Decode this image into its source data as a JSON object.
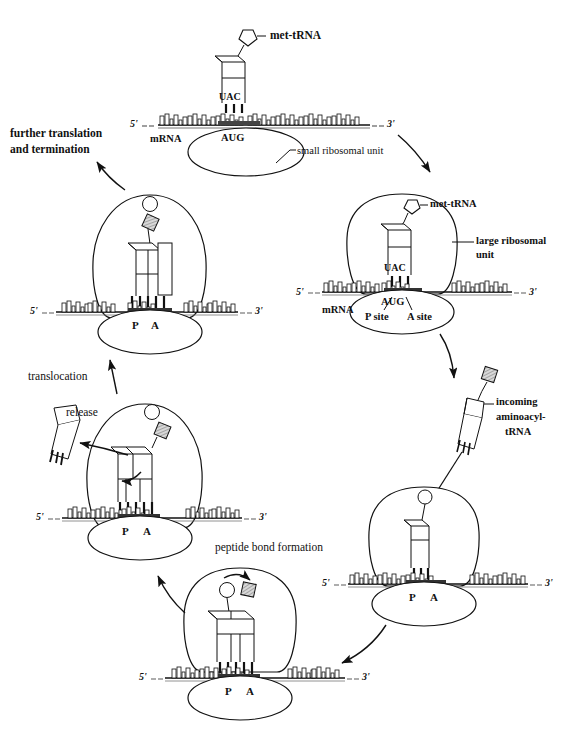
{
  "figure": {
    "type": "biology-process-diagram",
    "background_color": "#ffffff",
    "line_color": "#111111",
    "shading_color": "#9a9a9a"
  },
  "labels": {
    "met_trna_top": "met-tRNA",
    "met_trna_right": "met-tRNA",
    "mrna_top": "mRNA",
    "mrna_right": "mRNA",
    "small_ribosomal_unit": "small ribosomal unit",
    "large_ribosomal_unit": "large ribosomal\nunit",
    "large_ribosomal_unit_line1": "large ribosomal",
    "large_ribosomal_unit_line2": "unit",
    "further_translation_line1": "further translation",
    "further_translation_line2": "and termination",
    "translocation": "translocation",
    "release": "release",
    "peptide_bond_formation": "peptide bond formation",
    "incoming_line1": "incoming",
    "incoming_line2": "aminoacyl-",
    "incoming_line3": "tRNA",
    "p_site": "P site",
    "a_site": "A site",
    "p": "P",
    "a": "A",
    "five_prime": "5'",
    "three_prime": "3'",
    "codon_anticodon_uac": "UAC",
    "codon_aug": "AUG"
  },
  "stages": [
    {
      "id": "stage-1-initiation",
      "name": "initiation-small-subunit",
      "position": "top-center",
      "elements": [
        "mRNA strand",
        "small ribosomal unit",
        "met-tRNA",
        "UAC anticodon",
        "AUG codon"
      ],
      "labels": [
        "met-tRNA",
        "mRNA",
        "AUG",
        "UAC",
        "small ribosomal unit",
        "5'",
        "3'"
      ]
    },
    {
      "id": "stage-2-large-subunit-joins",
      "name": "large-subunit-assembly",
      "position": "middle-right",
      "elements": [
        "mRNA strand",
        "small ribosomal unit",
        "large ribosomal unit",
        "met-tRNA in P site"
      ],
      "labels": [
        "met-tRNA",
        "large ribosomal unit",
        "mRNA",
        "AUG",
        "UAC",
        "P site",
        "A site",
        "5'",
        "3'"
      ]
    },
    {
      "id": "stage-3-aminoacyl-trna-entry",
      "name": "incoming-aminoacyl-trna",
      "position": "lower-right",
      "elements": [
        "ribosome complex",
        "incoming aminoacyl-tRNA"
      ],
      "labels": [
        "incoming aminoacyl-tRNA",
        "P",
        "A",
        "5'",
        "3'"
      ]
    },
    {
      "id": "stage-4-peptide-bond",
      "name": "peptide-bond-formation",
      "position": "bottom-center",
      "elements": [
        "ribosome complex",
        "two tRNAs in P and A sites",
        "peptide bond arrow"
      ],
      "labels": [
        "peptide bond formation",
        "P",
        "A",
        "5'",
        "3'"
      ]
    },
    {
      "id": "stage-5-translocation-release",
      "name": "translocation-and-trna-release",
      "position": "middle-left",
      "elements": [
        "ribosome complex",
        "released empty tRNA",
        "translocation arrow"
      ],
      "labels": [
        "translocation",
        "release",
        "P",
        "A",
        "5'",
        "3'"
      ]
    },
    {
      "id": "stage-6-elongation",
      "name": "elongating-polypeptide",
      "position": "upper-left",
      "elements": [
        "ribosome complex",
        "growing peptide chain"
      ],
      "labels": [
        "further translation and termination",
        "P",
        "A",
        "5'",
        "3'"
      ]
    }
  ],
  "flow_arrows": [
    {
      "from": "stage-1-initiation",
      "to": "stage-2-large-subunit-joins",
      "direction": "down-right"
    },
    {
      "from": "stage-2-large-subunit-joins",
      "to": "stage-3-aminoacyl-trna-entry",
      "direction": "down"
    },
    {
      "from": "stage-3-aminoacyl-trna-entry",
      "to": "stage-4-peptide-bond",
      "direction": "down-left"
    },
    {
      "from": "stage-4-peptide-bond",
      "to": "stage-5-translocation-release",
      "direction": "up-left"
    },
    {
      "from": "stage-5-translocation-release",
      "to": "stage-6-elongation",
      "direction": "up"
    },
    {
      "from": "stage-6-elongation",
      "to": "further translation and termination",
      "direction": "up-left"
    }
  ]
}
